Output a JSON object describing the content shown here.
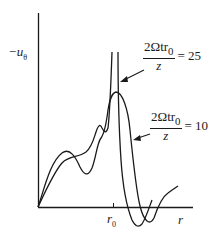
{
  "diagram": {
    "type": "line-plot-sketch",
    "y_axis_label": "−u",
    "y_axis_label_subscript": "θ",
    "x_axis_label": "r",
    "x_tick_label": "r",
    "x_tick_label_subscript": "0",
    "curves": [
      {
        "name": "curve-25",
        "annotation": {
          "numerator": "2Ωtr",
          "numerator_subscript": "0",
          "denominator": "z",
          "equals": "= 25"
        }
      },
      {
        "name": "curve-10",
        "annotation": {
          "numerator": "2Ωtr",
          "numerator_subscript": "0",
          "denominator": "z",
          "equals": "= 10"
        }
      }
    ]
  },
  "colors": {
    "ink": "#1a1a1a",
    "background": "#ffffff"
  }
}
